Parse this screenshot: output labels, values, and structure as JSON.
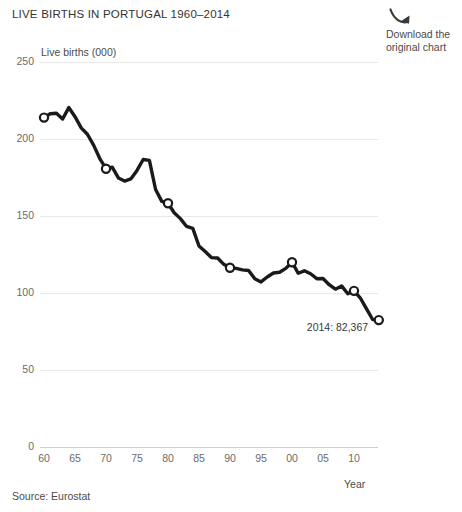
{
  "header": {
    "title": "LIVE BIRTHS IN PORTUGAL 1960–2014",
    "download_label": "Download the\noriginal chart",
    "download_icon": "curved-arrow-down-right-icon"
  },
  "footer": {
    "source": "Source: Eurostat"
  },
  "colors": {
    "line": "#1a1a1a",
    "grid": "#e8e8e8",
    "axis": "#cfcfcf",
    "text": "#3c3c3c",
    "tick_text": "#6b6b6b",
    "background": "#ffffff"
  },
  "chart_data": {
    "type": "line",
    "title": "LIVE BIRTHS IN PORTUGAL 1960–2014",
    "xlabel": "Year",
    "ylabel": "Live births (000)",
    "ylim": [
      0,
      250
    ],
    "xlim": [
      1960,
      2014
    ],
    "yticks": [
      0,
      50,
      100,
      150,
      200,
      250
    ],
    "ytick_labels": [
      "0",
      "50",
      "100",
      "150",
      "200",
      "250"
    ],
    "xticks": [
      1960,
      1965,
      1970,
      1975,
      1980,
      1985,
      1990,
      1995,
      2000,
      2005,
      2010
    ],
    "xtick_labels": [
      "60",
      "65",
      "70",
      "75",
      "80",
      "85",
      "90",
      "95",
      "00",
      "05",
      "10"
    ],
    "grid": true,
    "legend": false,
    "marker_years": [
      1960,
      1970,
      1980,
      1990,
      2000,
      2010,
      2014
    ],
    "annotations": [
      {
        "text": "2014: 82,367",
        "year": 2014,
        "value": 82.367
      }
    ],
    "series": [
      {
        "name": "Live births (000)",
        "x": [
          1960,
          1961,
          1962,
          1963,
          1964,
          1965,
          1966,
          1967,
          1968,
          1969,
          1970,
          1971,
          1972,
          1973,
          1974,
          1975,
          1976,
          1977,
          1978,
          1979,
          1980,
          1981,
          1982,
          1983,
          1984,
          1985,
          1986,
          1987,
          1988,
          1989,
          1990,
          1991,
          1992,
          1993,
          1994,
          1995,
          1996,
          1997,
          1998,
          1999,
          2000,
          2001,
          2002,
          2003,
          2004,
          2005,
          2006,
          2007,
          2008,
          2009,
          2010,
          2011,
          2012,
          2013,
          2014
        ],
        "y": [
          213.9,
          216.4,
          216.7,
          213.0,
          220.4,
          214.5,
          207.2,
          203.1,
          196.0,
          187.3,
          180.7,
          181.7,
          174.7,
          172.7,
          174.1,
          179.6,
          186.7,
          186.1,
          167.2,
          159.5,
          158.3,
          152.1,
          148.3,
          143.2,
          142.0,
          130.5,
          126.9,
          123.0,
          122.7,
          118.6,
          116.4,
          116.0,
          115.0,
          114.6,
          109.3,
          107.2,
          110.4,
          113.0,
          113.5,
          116.0,
          120.0,
          112.8,
          114.4,
          112.5,
          109.3,
          109.4,
          105.4,
          102.5,
          104.6,
          99.5,
          101.4,
          96.9,
          89.8,
          82.8,
          82.4
        ]
      }
    ]
  }
}
